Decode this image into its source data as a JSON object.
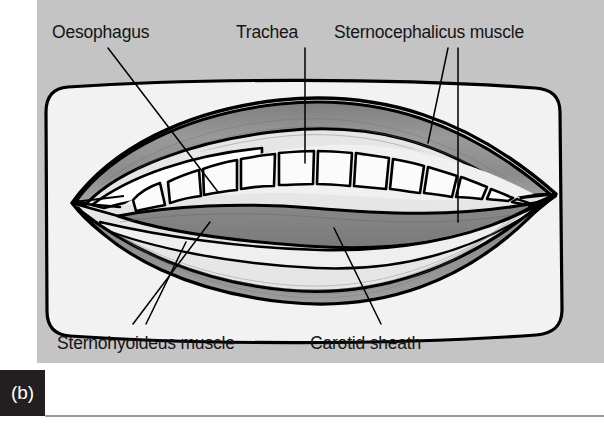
{
  "figure": {
    "tag": "(b)",
    "caption_labels": {
      "oesophagus": "Oesophagus",
      "trachea": "Trachea",
      "sternocephalicus": "Sternocephalicus muscle",
      "sternohyoideus": "Sternohyoideus muscle",
      "carotid_sheath": "Carotid sheath"
    }
  },
  "diagram": {
    "type": "anatomical-cross-section",
    "structures": [
      {
        "name": "oesophagus",
        "label": "Oesophagus",
        "fill": "#9c9c9c"
      },
      {
        "name": "trachea",
        "label": "Trachea",
        "fill": "#f7f7f7",
        "ring_count": 13
      },
      {
        "name": "sternocephalicus-muscle",
        "label": "Sternocephalicus muscle",
        "fill": "#8e8e8e"
      },
      {
        "name": "sternohyoideus-muscle",
        "label": "Sternohyoideus muscle",
        "fill": "#9a9a9a"
      },
      {
        "name": "carotid-sheath",
        "label": "Carotid sheath",
        "fill": "#848484"
      }
    ]
  },
  "colors": {
    "page_background": "#ffffff",
    "plate_background": "#c4c4c4",
    "panel_fill": "#f2f2f2",
    "outline": "#000000",
    "muscle_mid": "#8e8e8e",
    "muscle_light": "#b4b4b4",
    "muscle_dark": "#7d7d7d",
    "trachea_fill": "#f8f8f8",
    "tag_background": "#231f20",
    "tag_text": "#ffffff",
    "label_text": "#141414",
    "rule": "#9a9a9a"
  }
}
